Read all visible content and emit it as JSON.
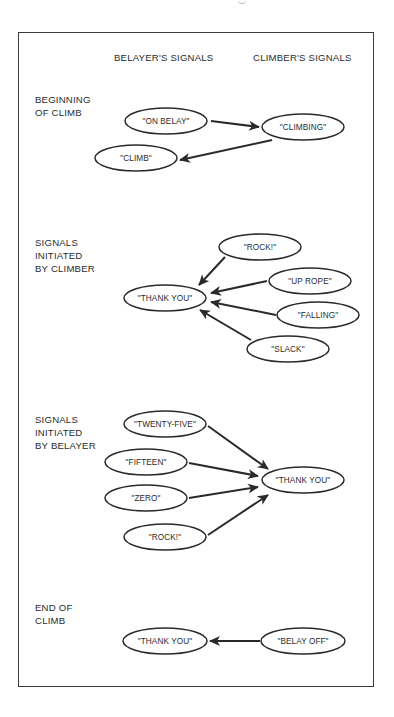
{
  "diagram": {
    "column_headers": {
      "belayer": "BELAYER'S SIGNALS",
      "climber": "CLIMBER'S SIGNALS"
    },
    "sections": [
      {
        "id": "beginning",
        "label": "BEGINNING\nOF CLIMB",
        "nodes": [
          {
            "id": "on-belay",
            "text": "\"ON BELAY\"",
            "side": "belayer"
          },
          {
            "id": "climbing",
            "text": "\"CLIMBING\"",
            "side": "climber"
          },
          {
            "id": "climb",
            "text": "\"CLIMB\"",
            "side": "belayer"
          }
        ],
        "edges": [
          {
            "from": "on-belay",
            "to": "climbing"
          },
          {
            "from": "climbing",
            "to": "climb"
          }
        ]
      },
      {
        "id": "initiated-by-climber",
        "label": "SIGNALS\nINITIATED\nBY CLIMBER",
        "nodes": [
          {
            "id": "rock-c",
            "text": "\"ROCK!\"",
            "side": "climber"
          },
          {
            "id": "up-rope",
            "text": "\"UP ROPE\"",
            "side": "climber"
          },
          {
            "id": "thank-you-b",
            "text": "\"THANK YOU\"",
            "side": "belayer"
          },
          {
            "id": "falling",
            "text": "\"FALLING\"",
            "side": "climber"
          },
          {
            "id": "slack",
            "text": "\"SLACK\"",
            "side": "climber"
          }
        ],
        "edges": [
          {
            "from": "rock-c",
            "to": "thank-you-b"
          },
          {
            "from": "up-rope",
            "to": "thank-you-b"
          },
          {
            "from": "falling",
            "to": "thank-you-b"
          },
          {
            "from": "slack",
            "to": "thank-you-b"
          }
        ]
      },
      {
        "id": "initiated-by-belayer",
        "label": "SIGNALS\nINITIATED\nBY BELAYER",
        "nodes": [
          {
            "id": "twenty-five",
            "text": "\"TWENTY-FIVE\"",
            "side": "belayer"
          },
          {
            "id": "fifteen",
            "text": "\"FIFTEEN\"",
            "side": "belayer"
          },
          {
            "id": "thank-you-c",
            "text": "\"THANK YOU\"",
            "side": "climber"
          },
          {
            "id": "zero",
            "text": "\"ZERO\"",
            "side": "belayer"
          },
          {
            "id": "rock-b",
            "text": "\"ROCK!\"",
            "side": "belayer"
          }
        ],
        "edges": [
          {
            "from": "twenty-five",
            "to": "thank-you-c"
          },
          {
            "from": "fifteen",
            "to": "thank-you-c"
          },
          {
            "from": "zero",
            "to": "thank-you-c"
          },
          {
            "from": "rock-b",
            "to": "thank-you-c"
          }
        ]
      },
      {
        "id": "end",
        "label": "END OF\nCLIMB",
        "nodes": [
          {
            "id": "thank-you-end",
            "text": "\"THANK YOU\"",
            "side": "belayer"
          },
          {
            "id": "belay-off",
            "text": "\"BELAY OFF\"",
            "side": "climber"
          }
        ],
        "edges": [
          {
            "from": "belay-off",
            "to": "thank-you-end"
          }
        ]
      }
    ],
    "colors": {
      "line": "#2a2a2a",
      "border": "#3a3a3a",
      "background": "#ffffff"
    }
  }
}
